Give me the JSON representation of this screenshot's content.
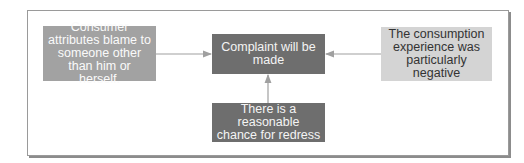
{
  "diagram": {
    "nodes": {
      "left": {
        "label": "Consumer attributes blame to someone other than him or herself."
      },
      "center": {
        "label": "Complaint will be made"
      },
      "bottom": {
        "label": "There is a reasonable chance for redress"
      },
      "right": {
        "label": "The consumption experience was particularly negative"
      }
    },
    "edges": [
      {
        "from": "left",
        "to": "center"
      },
      {
        "from": "right",
        "to": "center"
      },
      {
        "from": "bottom",
        "to": "center"
      }
    ],
    "colors": {
      "mid": "#a2a2a2",
      "dark": "#6e6e6e",
      "light": "#d4d4d4",
      "arrow": "#a0a0a0"
    }
  }
}
